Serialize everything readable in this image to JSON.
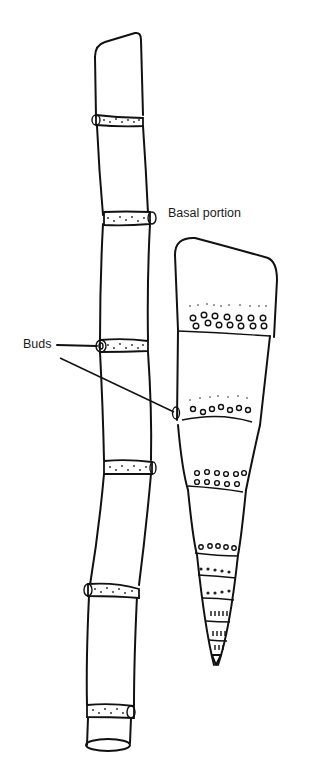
{
  "diagram": {
    "labels": {
      "basal": "Basal portion",
      "buds": "Buds"
    },
    "colors": {
      "ink": "#111111",
      "background": "#ffffff"
    }
  }
}
